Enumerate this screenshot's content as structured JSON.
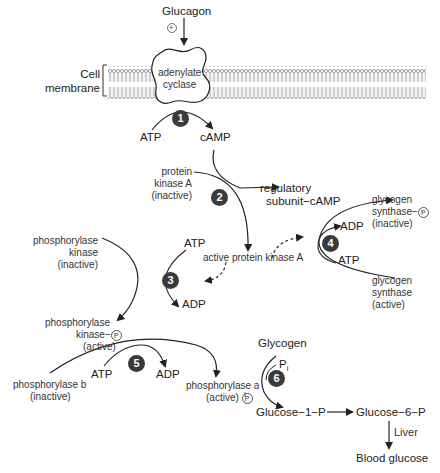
{
  "diagram": {
    "type": "signaling pathway",
    "hormone": "Glucagon",
    "stimulus_symbol": "+",
    "membrane_label": [
      "Cell",
      "membrane"
    ],
    "enzyme_in_membrane": [
      "adenylate",
      "cyclase"
    ],
    "steps": [
      {
        "number": "1",
        "substrate": "ATP",
        "product": "cAMP"
      },
      {
        "number": "2",
        "substrate": [
          "protein",
          "kinase A",
          "(inactive)"
        ],
        "products": [
          "regulatory",
          "subunit−cAMP"
        ],
        "main_product": "active protein kinase A"
      },
      {
        "number": "3",
        "substrate": [
          "phosphorylase",
          "kinase",
          "(inactive)"
        ],
        "cofactor_in": "ATP",
        "cofactor_out": "ADP",
        "product": [
          "phosphorylase",
          "kinase−",
          "(active)"
        ]
      },
      {
        "number": "4",
        "substrate": [
          "glycogen",
          "synthase",
          "(active)"
        ],
        "cofactor_in": "ATP",
        "cofactor_out": "ADP",
        "product": [
          "glycogen",
          "synthase−",
          "(inactive)"
        ]
      },
      {
        "number": "5",
        "substrate": [
          "phosphorylase b",
          "(inactive)"
        ],
        "cofactor_in": "ATP",
        "cofactor_out": "ADP",
        "product": [
          "phosphorylase a",
          "(active)"
        ]
      },
      {
        "number": "6",
        "substrate": "Glycogen",
        "cofactor_in": "P",
        "cofactor_sub": "i",
        "product": "Glucose−1−P"
      }
    ],
    "phosphate_symbol": "P",
    "downstream": {
      "g1p": "Glucose−1−P",
      "g6p": "Glucose−6−P",
      "organ": "Liver",
      "final": "Blood glucose"
    }
  }
}
